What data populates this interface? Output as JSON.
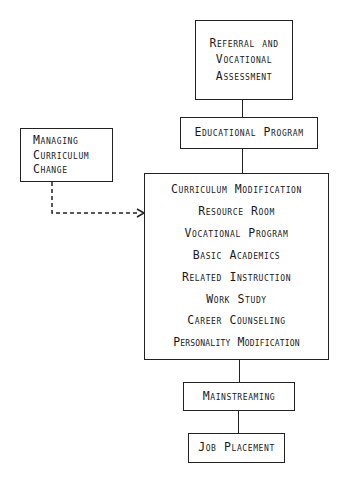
{
  "diagram": {
    "boxes": {
      "referral": {
        "lines": [
          "Referral and",
          "Vocational",
          "Assessment"
        ]
      },
      "educational_program": {
        "label": "Educational Program"
      },
      "managing_change": {
        "lines": [
          "Managing",
          "Curriculum",
          "Change"
        ]
      },
      "components": {
        "items": [
          "Curriculum Modification",
          "Resource Room",
          "Vocational Program",
          "Basic Academics",
          "Related Instruction",
          "Work Study",
          "Career Counseling",
          "Personality Modification"
        ]
      },
      "mainstreaming": {
        "label": "Mainstreaming"
      },
      "job_placement": {
        "label": "Job Placement"
      }
    },
    "connectors": [
      {
        "from": "referral",
        "to": "educational_program",
        "style": "solid"
      },
      {
        "from": "educational_program",
        "to": "components",
        "style": "solid"
      },
      {
        "from": "managing_change",
        "to": "components",
        "style": "dashed-arrow"
      },
      {
        "from": "components",
        "to": "mainstreaming",
        "style": "solid"
      },
      {
        "from": "mainstreaming",
        "to": "job_placement",
        "style": "solid"
      }
    ]
  }
}
